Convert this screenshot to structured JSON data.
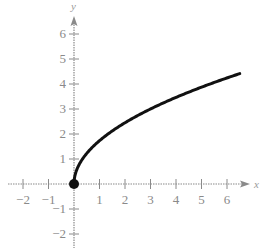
{
  "chart_data": {
    "type": "line",
    "title": "",
    "xlabel": "x",
    "ylabel": "y",
    "function": "y = sqrt(3x)",
    "xlim": [
      -2.5,
      6.9
    ],
    "ylim": [
      -2.6,
      6.6
    ],
    "grid": false,
    "xticks": [
      -2,
      -1,
      1,
      2,
      3,
      4,
      5,
      6
    ],
    "yticks": [
      -2,
      -1,
      1,
      2,
      3,
      4,
      5,
      6
    ],
    "xtick_labels": [
      "−2",
      "−1",
      "1",
      "2",
      "3",
      "4",
      "5",
      "6"
    ],
    "ytick_labels": [
      "−2",
      "−1",
      "1",
      "2",
      "3",
      "4",
      "5",
      "6"
    ],
    "series": [
      {
        "name": "curve",
        "x": [
          0,
          0.25,
          0.5,
          1,
          1.5,
          2,
          3,
          4,
          5,
          6,
          6.5
        ],
        "y": [
          0,
          0.87,
          1.22,
          1.73,
          2.12,
          2.45,
          3.0,
          3.46,
          3.87,
          4.24,
          4.42
        ]
      }
    ],
    "endpoint": {
      "x": 0,
      "y": 0,
      "style": "filled-dot"
    },
    "colors": {
      "curve": "#111111",
      "axes": "#8a8a8a"
    }
  }
}
